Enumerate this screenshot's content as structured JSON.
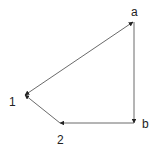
{
  "diagram": {
    "type": "directed-graph",
    "nodes": [
      {
        "id": "a",
        "label": "a",
        "x": 134,
        "y": 22
      },
      {
        "id": "b",
        "label": "b",
        "x": 134,
        "y": 123
      },
      {
        "id": "2",
        "label": "2",
        "x": 60,
        "y": 123
      },
      {
        "id": "1",
        "label": "1",
        "x": 24,
        "y": 94
      }
    ],
    "edges": [
      {
        "from": "1",
        "to": "a"
      },
      {
        "from": "a",
        "to": "1"
      },
      {
        "from": "a",
        "to": "b"
      },
      {
        "from": "b",
        "to": "2"
      },
      {
        "from": "2",
        "to": "1"
      }
    ],
    "colors": {
      "line": "#333333",
      "text": "#222222"
    }
  }
}
